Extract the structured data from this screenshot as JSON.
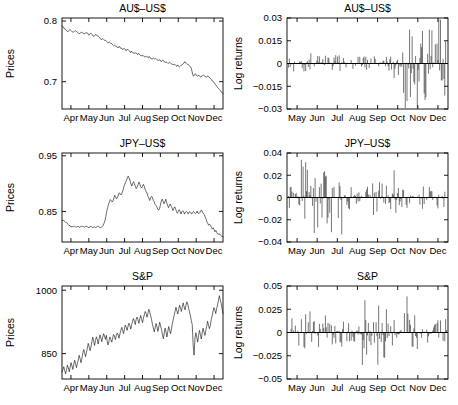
{
  "figure": {
    "background": "#ffffff",
    "foreground": "#000000",
    "rows": 3,
    "cols": 2,
    "width": 458,
    "height": 405
  },
  "chart_data": [
    {
      "id": "au-prices",
      "type": "line",
      "title": "AU$–US$",
      "xlabel": "",
      "ylabel": "Prices",
      "ylim": [
        0.655,
        0.805
      ],
      "yticks": [
        0.7,
        0.8
      ],
      "ytick_labels": [
        "0.7",
        "0.8"
      ],
      "xticks": [
        "Apr",
        "May",
        "Jun",
        "Jul",
        "Aug",
        "Sep",
        "Oct",
        "Nov",
        "Dec"
      ],
      "grid": false,
      "legend": "none",
      "x": [
        0,
        1,
        2,
        3,
        4,
        5,
        6,
        7,
        8,
        9,
        10,
        11,
        12,
        13,
        14,
        15,
        16,
        17,
        18,
        19,
        20,
        21,
        22,
        23,
        24,
        25,
        26,
        27,
        28,
        29,
        30,
        31,
        32,
        33,
        34,
        35,
        36,
        37,
        38,
        39,
        40,
        41,
        42,
        43,
        44,
        45,
        46,
        47,
        48,
        49,
        50,
        51,
        52,
        53,
        54,
        55,
        56,
        57,
        58,
        59,
        60,
        61,
        62,
        63,
        64,
        65,
        66,
        67,
        68,
        69,
        70,
        71,
        72,
        73,
        74,
        75,
        76,
        77,
        78,
        79,
        80,
        81,
        82,
        83,
        84,
        85,
        86,
        87,
        88,
        89,
        90,
        91,
        92,
        93,
        94,
        95,
        96,
        97,
        98,
        99,
        100,
        101,
        102,
        103,
        104,
        105,
        106,
        107,
        108,
        109,
        110,
        111,
        112,
        113,
        114,
        115,
        116,
        117,
        118,
        119,
        120,
        121,
        122,
        123,
        124,
        125,
        126,
        127,
        128,
        129,
        130,
        131,
        132,
        133,
        134,
        135,
        136,
        137,
        138,
        139,
        140,
        141,
        142,
        143,
        144,
        145,
        146,
        147,
        148,
        149,
        150,
        151,
        152,
        153,
        154,
        155,
        156,
        157,
        158,
        159,
        160,
        161,
        162,
        163,
        164,
        165,
        166,
        167,
        168,
        169,
        170,
        171,
        172,
        173,
        174,
        175,
        176,
        177,
        178,
        179
      ],
      "values": [
        0.7915,
        0.7905,
        0.7885,
        0.7872,
        0.7858,
        0.7843,
        0.7835,
        0.7828,
        0.7842,
        0.7855,
        0.7848,
        0.7836,
        0.7825,
        0.7818,
        0.783,
        0.7842,
        0.7833,
        0.782,
        0.7812,
        0.78,
        0.7792,
        0.7805,
        0.7818,
        0.781,
        0.7798,
        0.7785,
        0.7795,
        0.7808,
        0.78,
        0.7788,
        0.7775,
        0.7782,
        0.7793,
        0.7785,
        0.777,
        0.7758,
        0.7748,
        0.776,
        0.7772,
        0.7765,
        0.7752,
        0.774,
        0.773,
        0.7718,
        0.7705,
        0.7695,
        0.7708,
        0.77,
        0.7688,
        0.7675,
        0.7662,
        0.765,
        0.764,
        0.7652,
        0.7645,
        0.7632,
        0.762,
        0.7608,
        0.7598,
        0.761,
        0.76,
        0.7588,
        0.7575,
        0.7565,
        0.7578,
        0.7568,
        0.7555,
        0.7545,
        0.7535,
        0.7548,
        0.754,
        0.7528,
        0.7518,
        0.753,
        0.7522,
        0.751,
        0.7498,
        0.7488,
        0.75,
        0.749,
        0.7478,
        0.7468,
        0.748,
        0.747,
        0.7458,
        0.7448,
        0.746,
        0.7452,
        0.744,
        0.743,
        0.7442,
        0.7435,
        0.7422,
        0.7412,
        0.7425,
        0.7418,
        0.7405,
        0.7395,
        0.7408,
        0.74,
        0.7388,
        0.7378,
        0.739,
        0.7382,
        0.737,
        0.7382,
        0.7375,
        0.7362,
        0.7352,
        0.7365,
        0.7358,
        0.7345,
        0.7335,
        0.7348,
        0.734,
        0.7328,
        0.7318,
        0.733,
        0.7322,
        0.731,
        0.73,
        0.7312,
        0.7305,
        0.7292,
        0.7282,
        0.7272,
        0.7285,
        0.7278,
        0.7265,
        0.7255,
        0.7268,
        0.726,
        0.7248,
        0.726,
        0.7272,
        0.7285,
        0.7298,
        0.731,
        0.7322,
        0.7315,
        0.7302,
        0.729,
        0.7278,
        0.7265,
        0.7252,
        0.724,
        0.718,
        0.712,
        0.7095,
        0.711,
        0.7125,
        0.7105,
        0.7085,
        0.7098,
        0.7112,
        0.7092,
        0.7075,
        0.7088,
        0.7102,
        0.7115,
        0.71,
        0.7085,
        0.707,
        0.7082,
        0.7095,
        0.7078,
        0.706,
        0.7045,
        0.703,
        0.7012,
        0.6995,
        0.698,
        0.6962,
        0.6945,
        0.6928,
        0.691,
        0.689,
        0.6872,
        0.6855,
        0.6838,
        0.682,
        0.68
      ]
    },
    {
      "id": "au-returns",
      "type": "line",
      "title": "AU$–US$",
      "xlabel": "",
      "ylabel": "Log returns",
      "ylim": [
        -0.03,
        0.03
      ],
      "yticks": [
        -0.03,
        -0.015,
        0,
        0.015,
        0.03
      ],
      "ytick_labels": [
        "−0.03",
        "−0.015",
        "0",
        "0.015",
        "0.03"
      ],
      "xticks": [
        "May",
        "Jun",
        "Jul",
        "Aug",
        "Sep",
        "Oct",
        "Nov",
        "Dec"
      ],
      "grid": false,
      "legend": "none",
      "series_kind": "log-returns",
      "note": "dense vertical spikes around a zero baseline; volatility rises from Oct onwards with a maximum spike near +0.021 in early Nov"
    },
    {
      "id": "jpy-prices",
      "type": "line",
      "title": "JPY–US$",
      "xlabel": "",
      "ylabel": "Prices",
      "ylim": [
        0.795,
        0.955
      ],
      "yticks": [
        0.85,
        0.95
      ],
      "ytick_labels": [
        "0.85",
        "0.95"
      ],
      "xticks": [
        "Apr",
        "May",
        "Jun",
        "Jul",
        "Aug",
        "Sep",
        "Oct",
        "Nov",
        "Dec"
      ],
      "grid": false,
      "legend": "none",
      "x": [
        0,
        1,
        2,
        3,
        4,
        5,
        6,
        7,
        8,
        9,
        10,
        11,
        12,
        13,
        14,
        15,
        16,
        17,
        18,
        19,
        20,
        21,
        22,
        23,
        24,
        25,
        26,
        27,
        28,
        29,
        30,
        31,
        32,
        33,
        34,
        35,
        36,
        37,
        38,
        39,
        40,
        41,
        42,
        43,
        44,
        45,
        46,
        47,
        48,
        49,
        50,
        51,
        52,
        53,
        54,
        55,
        56,
        57,
        58,
        59,
        60,
        61,
        62,
        63,
        64,
        65,
        66,
        67,
        68,
        69,
        70,
        71,
        72,
        73,
        74,
        75,
        76,
        77,
        78,
        79,
        80,
        81,
        82,
        83,
        84,
        85,
        86,
        87,
        88,
        89,
        90,
        91,
        92,
        93,
        94,
        95,
        96,
        97,
        98,
        99,
        100,
        101,
        102,
        103,
        104,
        105,
        106,
        107,
        108,
        109,
        110,
        111,
        112,
        113,
        114,
        115,
        116,
        117,
        118,
        119,
        120,
        121,
        122,
        123,
        124,
        125,
        126,
        127,
        128,
        129,
        130,
        131,
        132,
        133,
        134,
        135,
        136,
        137,
        138,
        139,
        140,
        141,
        142,
        143,
        144,
        145,
        146,
        147,
        148,
        149,
        150,
        151,
        152,
        153,
        154,
        155,
        156,
        157,
        158,
        159,
        160,
        161,
        162,
        163,
        164,
        165,
        166,
        167,
        168,
        169,
        170,
        171,
        172,
        173,
        174,
        175,
        176,
        177,
        178,
        179
      ],
      "values": [
        0.8345,
        0.8338,
        0.8328,
        0.8318,
        0.8305,
        0.8292,
        0.828,
        0.8268,
        0.8255,
        0.824,
        0.8228,
        0.8218,
        0.8225,
        0.8235,
        0.8228,
        0.8218,
        0.8222,
        0.8232,
        0.8225,
        0.8215,
        0.8222,
        0.8232,
        0.824,
        0.8232,
        0.8222,
        0.8215,
        0.8225,
        0.8235,
        0.8228,
        0.8218,
        0.821,
        0.822,
        0.823,
        0.8222,
        0.8212,
        0.822,
        0.8228,
        0.8218,
        0.821,
        0.8218,
        0.8228,
        0.822,
        0.8212,
        0.8205,
        0.8215,
        0.8225,
        0.824,
        0.828,
        0.834,
        0.842,
        0.85,
        0.856,
        0.862,
        0.868,
        0.872,
        0.87,
        0.866,
        0.869,
        0.874,
        0.878,
        0.876,
        0.872,
        0.875,
        0.88,
        0.884,
        0.882,
        0.879,
        0.883,
        0.888,
        0.893,
        0.898,
        0.902,
        0.906,
        0.91,
        0.914,
        0.91,
        0.905,
        0.9,
        0.896,
        0.9,
        0.904,
        0.9,
        0.895,
        0.89,
        0.894,
        0.898,
        0.902,
        0.899,
        0.895,
        0.891,
        0.895,
        0.898,
        0.894,
        0.89,
        0.886,
        0.882,
        0.878,
        0.874,
        0.87,
        0.874,
        0.878,
        0.875,
        0.871,
        0.867,
        0.863,
        0.86,
        0.857,
        0.855,
        0.853,
        0.856,
        0.862,
        0.868,
        0.872,
        0.868,
        0.863,
        0.867,
        0.871,
        0.866,
        0.861,
        0.857,
        0.86,
        0.864,
        0.86,
        0.856,
        0.852,
        0.855,
        0.858,
        0.854,
        0.85,
        0.847,
        0.85,
        0.853,
        0.849,
        0.846,
        0.849,
        0.852,
        0.849,
        0.846,
        0.849,
        0.851,
        0.848,
        0.846,
        0.848,
        0.85,
        0.848,
        0.846,
        0.848,
        0.85,
        0.848,
        0.846,
        0.848,
        0.85,
        0.848,
        0.846,
        0.848,
        0.8505,
        0.852,
        0.85,
        0.847,
        0.844,
        0.84,
        0.836,
        0.832,
        0.828,
        0.825,
        0.827,
        0.824,
        0.821,
        0.818,
        0.82,
        0.817,
        0.814,
        0.816,
        0.813,
        0.81,
        0.808,
        0.81,
        0.807,
        0.805,
        0.806,
        0.804
      ]
    },
    {
      "id": "jpy-returns",
      "type": "line",
      "title": "JPY–US$",
      "xlabel": "",
      "ylabel": "Log returns",
      "ylim": [
        -0.04,
        0.04
      ],
      "yticks": [
        -0.04,
        -0.02,
        0,
        0.02,
        0.04
      ],
      "ytick_labels": [
        "−0.04",
        "−0.02",
        "0",
        "0.02",
        "0.04"
      ],
      "xticks": [
        "May",
        "Jun",
        "Jul",
        "Aug",
        "Sep",
        "Oct",
        "Nov",
        "Dec"
      ],
      "grid": false,
      "legend": "none",
      "series_kind": "log-returns",
      "note": "volatility cluster in May-Jun; largest negative spike near −0.030 in mid Jun; positive spikes up to +0.020 in May, Sep and Oct"
    },
    {
      "id": "sp-prices",
      "type": "line",
      "title": "S&P",
      "xlabel": "",
      "ylabel": "Prices",
      "ylim": [
        790,
        1010
      ],
      "yticks": [
        850,
        1000
      ],
      "ytick_labels": [
        "850",
        "1000"
      ],
      "xticks": [
        "Apr",
        "May",
        "Jun",
        "Jul",
        "Aug",
        "Sep",
        "Oct",
        "Nov",
        "Dec"
      ],
      "grid": false,
      "legend": "none",
      "x": [
        0,
        1,
        2,
        3,
        4,
        5,
        6,
        7,
        8,
        9,
        10,
        11,
        12,
        13,
        14,
        15,
        16,
        17,
        18,
        19,
        20,
        21,
        22,
        23,
        24,
        25,
        26,
        27,
        28,
        29,
        30,
        31,
        32,
        33,
        34,
        35,
        36,
        37,
        38,
        39,
        40,
        41,
        42,
        43,
        44,
        45,
        46,
        47,
        48,
        49,
        50,
        51,
        52,
        53,
        54,
        55,
        56,
        57,
        58,
        59,
        60,
        61,
        62,
        63,
        64,
        65,
        66,
        67,
        68,
        69,
        70,
        71,
        72,
        73,
        74,
        75,
        76,
        77,
        78,
        79,
        80,
        81,
        82,
        83,
        84,
        85,
        86,
        87,
        88,
        89,
        90,
        91,
        92,
        93,
        94,
        95,
        96,
        97,
        98,
        99,
        100,
        101,
        102,
        103,
        104,
        105,
        106,
        107,
        108,
        109,
        110,
        111,
        112,
        113,
        114,
        115,
        116,
        117,
        118,
        119,
        120,
        121,
        122,
        123,
        124,
        125,
        126,
        127,
        128,
        129,
        130,
        131,
        132,
        133,
        134,
        135,
        136,
        137,
        138,
        139,
        140,
        141,
        142,
        143,
        144,
        145,
        146,
        147,
        148,
        149,
        150,
        151,
        152,
        153,
        154,
        155,
        156,
        157,
        158,
        159,
        160,
        161,
        162,
        163,
        164,
        165,
        166,
        167,
        168,
        169,
        170,
        171,
        172,
        173,
        174,
        175,
        176,
        177,
        178,
        179
      ],
      "values": [
        806,
        812,
        818,
        810,
        802,
        812,
        822,
        816,
        808,
        818,
        828,
        820,
        812,
        824,
        834,
        826,
        816,
        826,
        836,
        846,
        838,
        828,
        838,
        850,
        860,
        852,
        842,
        852,
        864,
        874,
        866,
        856,
        866,
        878,
        888,
        880,
        870,
        880,
        890,
        884,
        874,
        884,
        894,
        888,
        878,
        888,
        898,
        892,
        884,
        894,
        880,
        870,
        880,
        890,
        884,
        876,
        886,
        896,
        890,
        882,
        892,
        900,
        894,
        886,
        896,
        904,
        912,
        906,
        898,
        908,
        918,
        912,
        904,
        914,
        922,
        916,
        908,
        918,
        926,
        934,
        928,
        920,
        930,
        938,
        930,
        922,
        932,
        940,
        932,
        924,
        934,
        942,
        950,
        944,
        936,
        946,
        954,
        948,
        940,
        930,
        920,
        910,
        900,
        912,
        922,
        914,
        904,
        914,
        924,
        916,
        906,
        896,
        886,
        898,
        910,
        900,
        890,
        902,
        914,
        906,
        896,
        908,
        920,
        930,
        940,
        950,
        960,
        952,
        944,
        954,
        964,
        958,
        950,
        960,
        970,
        962,
        954,
        964,
        974,
        968,
        958,
        948,
        938,
        928,
        918,
        870,
        846,
        886,
        900,
        890,
        878,
        892,
        906,
        896,
        886,
        898,
        910,
        902,
        892,
        904,
        916,
        926,
        918,
        908,
        918,
        930,
        940,
        950,
        960,
        954,
        946,
        956,
        966,
        976,
        986,
        978,
        968,
        956,
        944
      ]
    },
    {
      "id": "sp-returns",
      "type": "line",
      "title": "S&P",
      "xlabel": "",
      "ylabel": "Log returns",
      "ylim": [
        -0.05,
        0.05
      ],
      "yticks": [
        -0.05,
        -0.025,
        0,
        0.025,
        0.05
      ],
      "ytick_labels": [
        "−0.05",
        "−0.025",
        "0",
        "0.025",
        "0.05"
      ],
      "xticks": [
        "May",
        "Jun",
        "Jul",
        "Aug",
        "Sep",
        "Oct",
        "Nov",
        "Dec"
      ],
      "grid": false,
      "legend": "none",
      "series_kind": "log-returns",
      "note": "largest negative spike near −0.046 in early Nov; frequent positive spikes up to +0.026 in May, Jul, Sep and Oct"
    }
  ]
}
